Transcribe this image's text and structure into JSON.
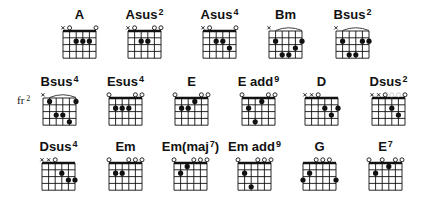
{
  "diagram": {
    "strings": 6,
    "frets_shown": 4,
    "string_spacing": 6.6,
    "fret_spacing": 6.8,
    "colors": {
      "ink": "#111111",
      "faded_marker": "#c8c8c8",
      "background": "#ffffff"
    }
  },
  "chords": [
    {
      "id": "A",
      "name": "A",
      "sup": "",
      "gx": 63,
      "gy": 31,
      "fret_label": "",
      "nut": true,
      "markers": [
        "x",
        "o",
        "",
        "",
        "",
        "o"
      ],
      "faded": [],
      "dots": [
        [
          2,
          2
        ],
        [
          3,
          2
        ],
        [
          4,
          2
        ]
      ],
      "barre": null
    },
    {
      "id": "Asus2",
      "name": "Asus",
      "sup": "2",
      "gx": 128,
      "gy": 31,
      "fret_label": "",
      "nut": true,
      "markers": [
        "x",
        "o",
        "",
        "",
        "o",
        "o"
      ],
      "faded": [],
      "dots": [
        [
          2,
          2
        ],
        [
          3,
          2
        ]
      ],
      "barre": null
    },
    {
      "id": "Asus4",
      "name": "Asus",
      "sup": "4",
      "gx": 203,
      "gy": 31,
      "fret_label": "",
      "nut": true,
      "markers": [
        "x",
        "o",
        "",
        "",
        "",
        "o"
      ],
      "faded": [],
      "dots": [
        [
          2,
          2
        ],
        [
          3,
          2
        ],
        [
          4,
          3
        ]
      ],
      "barre": null
    },
    {
      "id": "Bm",
      "name": "Bm",
      "sup": "",
      "gx": 269,
      "gy": 31,
      "fret_label": "",
      "nut": false,
      "markers": [
        "x",
        "",
        "",
        "",
        "",
        ""
      ],
      "faded": [],
      "dots": [
        [
          1,
          2
        ],
        [
          2,
          4
        ],
        [
          3,
          4
        ],
        [
          4,
          3
        ],
        [
          5,
          2
        ]
      ],
      "barre": [
        1,
        5,
        2
      ]
    },
    {
      "id": "Bsus2",
      "name": "Bsus",
      "sup": "2",
      "gx": 336,
      "gy": 31,
      "fret_label": "",
      "nut": false,
      "markers": [
        "x",
        "",
        "",
        "",
        "",
        ""
      ],
      "faded": [],
      "dots": [
        [
          1,
          2
        ],
        [
          2,
          4
        ],
        [
          3,
          4
        ],
        [
          4,
          2
        ],
        [
          5,
          2
        ]
      ],
      "barre": [
        1,
        5,
        2
      ]
    },
    {
      "id": "Bsus4",
      "name": "Bsus",
      "sup": "4",
      "gx": 43,
      "gy": 98,
      "fret_label": "fr",
      "fret_num": "2",
      "nut": false,
      "markers": [
        "x",
        "",
        "",
        "",
        "",
        ""
      ],
      "faded": [],
      "dots": [
        [
          1,
          1
        ],
        [
          2,
          3
        ],
        [
          3,
          3
        ],
        [
          4,
          4
        ],
        [
          5,
          1
        ]
      ],
      "barre": [
        1,
        5,
        1
      ]
    },
    {
      "id": "Esus4",
      "name": "Esus",
      "sup": "4",
      "gx": 109,
      "gy": 98,
      "fret_label": "",
      "nut": true,
      "markers": [
        "o",
        "",
        "",
        "",
        "o",
        "o"
      ],
      "faded": [],
      "dots": [
        [
          1,
          2
        ],
        [
          2,
          2
        ],
        [
          3,
          2
        ]
      ],
      "barre": null
    },
    {
      "id": "E",
      "name": "E",
      "sup": "",
      "gx": 175,
      "gy": 98,
      "fret_label": "",
      "nut": true,
      "markers": [
        "o",
        "",
        "",
        "",
        "o",
        "o"
      ],
      "faded": [],
      "dots": [
        [
          1,
          2
        ],
        [
          2,
          2
        ],
        [
          3,
          1
        ]
      ],
      "barre": null
    },
    {
      "id": "Eadd9",
      "name": "E add",
      "sup": "9",
      "gx": 242,
      "gy": 98,
      "fret_label": "",
      "nut": true,
      "markers": [
        "o",
        "",
        "",
        "",
        "o",
        "o"
      ],
      "faded": [],
      "dots": [
        [
          1,
          2
        ],
        [
          2,
          4
        ],
        [
          3,
          1
        ]
      ],
      "barre": null
    },
    {
      "id": "D",
      "name": "D",
      "sup": "",
      "gx": 305,
      "gy": 98,
      "fret_label": "",
      "nut": true,
      "markers": [
        "x",
        "x",
        "o",
        "",
        "",
        ""
      ],
      "faded": [],
      "dots": [
        [
          3,
          2
        ],
        [
          4,
          3
        ],
        [
          5,
          2
        ]
      ],
      "barre": null
    },
    {
      "id": "Dsus2",
      "name": "Dsus",
      "sup": "2",
      "gx": 372,
      "gy": 98,
      "fret_label": "",
      "nut": true,
      "markers": [
        "x",
        "x",
        "o",
        "",
        "",
        "o"
      ],
      "faded": [
        3,
        4
      ],
      "dots": [
        [
          3,
          2
        ],
        [
          4,
          3
        ]
      ],
      "barre": null
    },
    {
      "id": "Dsus4",
      "name": "Dsus",
      "sup": "4",
      "gx": 42,
      "gy": 163,
      "fret_label": "",
      "nut": true,
      "markers": [
        "x",
        "x",
        "o",
        "",
        "",
        ""
      ],
      "faded": [],
      "dots": [
        [
          3,
          2
        ],
        [
          4,
          3
        ],
        [
          5,
          3
        ]
      ],
      "barre": null
    },
    {
      "id": "Em",
      "name": "Em",
      "sup": "",
      "gx": 109,
      "gy": 163,
      "fret_label": "",
      "nut": true,
      "markers": [
        "o",
        "",
        "",
        "o",
        "o",
        "o"
      ],
      "faded": [],
      "dots": [
        [
          1,
          2
        ],
        [
          2,
          2
        ]
      ],
      "barre": null
    },
    {
      "id": "Emmaj7",
      "name": "Em(maj",
      "sup": "7",
      "gx": 174,
      "gy": 163,
      "fret_label": "",
      "nut": true,
      "suffix": ")",
      "markers": [
        "o",
        "",
        "",
        "o",
        "o",
        "o"
      ],
      "faded": [],
      "dots": [
        [
          1,
          2
        ],
        [
          2,
          1
        ]
      ],
      "barre": null
    },
    {
      "id": "Emadd9",
      "name": "Em add",
      "sup": "9",
      "gx": 238,
      "gy": 163,
      "fret_label": "",
      "nut": true,
      "markers": [
        "o",
        "",
        "",
        "o",
        "o",
        "o"
      ],
      "faded": [],
      "dots": [
        [
          1,
          2
        ],
        [
          2,
          4
        ]
      ],
      "barre": null
    },
    {
      "id": "G",
      "name": "G",
      "sup": "",
      "gx": 303,
      "gy": 163,
      "fret_label": "",
      "nut": true,
      "markers": [
        "",
        "",
        "o",
        "o",
        "o",
        ""
      ],
      "faded": [],
      "dots": [
        [
          0,
          3
        ],
        [
          1,
          2
        ],
        [
          5,
          3
        ]
      ],
      "barre": null
    },
    {
      "id": "E7",
      "name": "E",
      "sup": "7",
      "gx": 369,
      "gy": 163,
      "fret_label": "",
      "nut": true,
      "markers": [
        "o",
        "",
        "o",
        "",
        "o",
        "o"
      ],
      "faded": [],
      "dots": [
        [
          1,
          2
        ],
        [
          3,
          1
        ]
      ],
      "barre": null
    }
  ]
}
